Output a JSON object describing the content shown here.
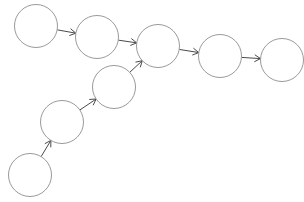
{
  "diagram": {
    "type": "directed-graph",
    "node_radius": 21.5,
    "colors": {
      "node_stroke": "#9a9a9a",
      "edge": "#4a4a4a",
      "background": "#ffffff"
    },
    "nodes": [
      {
        "id": "n1",
        "label": "",
        "cx": 36,
        "cy": 26
      },
      {
        "id": "n2",
        "label": "",
        "cx": 97,
        "cy": 37
      },
      {
        "id": "n3",
        "label": "",
        "cx": 158,
        "cy": 46
      },
      {
        "id": "n4",
        "label": "",
        "cx": 220,
        "cy": 56
      },
      {
        "id": "n5",
        "label": "",
        "cx": 282,
        "cy": 60
      },
      {
        "id": "n6",
        "label": "",
        "cx": 114,
        "cy": 87
      },
      {
        "id": "n7",
        "label": "",
        "cx": 62,
        "cy": 122
      },
      {
        "id": "n8",
        "label": "",
        "cx": 30,
        "cy": 175
      }
    ],
    "edges": [
      {
        "from": "n1",
        "to": "n2"
      },
      {
        "from": "n2",
        "to": "n3"
      },
      {
        "from": "n3",
        "to": "n4"
      },
      {
        "from": "n4",
        "to": "n5"
      },
      {
        "from": "n8",
        "to": "n7"
      },
      {
        "from": "n7",
        "to": "n6"
      },
      {
        "from": "n6",
        "to": "n3"
      }
    ]
  }
}
